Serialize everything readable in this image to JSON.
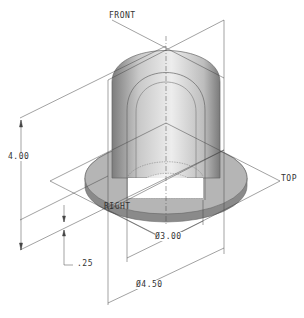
{
  "drawing": {
    "type": "isometric CAD view",
    "part": "dome cap with flange (cutaway)",
    "datum_planes": {
      "front": "FRONT",
      "top": "TOP",
      "right": "RIGHT"
    },
    "dimensions": {
      "height": "4.00",
      "flange_thickness": ".25",
      "inner_diameter": "Ø3.00",
      "outer_diameter": "Ø4.50"
    },
    "colors": {
      "line": "#555555",
      "shade_dark": "#8a8a8a",
      "shade_light": "#e6e6e6",
      "background": "#ffffff"
    }
  }
}
